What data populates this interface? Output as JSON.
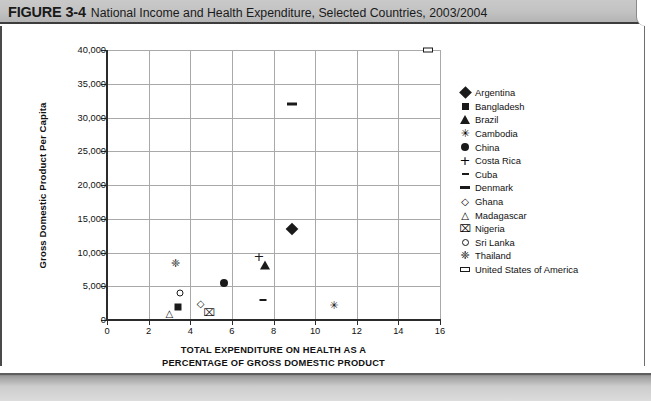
{
  "header": {
    "figure_label": "FIGURE 3-4",
    "figure_title": "National Income and Health Expenditure, Selected Countries, 2003/2004"
  },
  "chart_data": {
    "type": "scatter",
    "title": "National Income and Health Expenditure, Selected Countries, 2003/2004",
    "xlabel_line1": "TOTAL EXPENDITURE ON HEALTH AS A",
    "xlabel_line2": "PERCENTAGE OF GROSS DOMESTIC PRODUCT",
    "ylabel": "Gross Domestic Product Per Capita",
    "xlim": [
      0,
      16
    ],
    "ylim": [
      0,
      40000
    ],
    "xticks": [
      "0",
      "2",
      "4",
      "6",
      "8",
      "10",
      "12",
      "14",
      "16"
    ],
    "xtick_values": [
      0,
      2,
      4,
      6,
      8,
      10,
      12,
      14,
      16
    ],
    "yticks": [
      "0",
      "5,000",
      "10,000",
      "15,000",
      "20,000",
      "25,000",
      "30,000",
      "35,000",
      "40,000"
    ],
    "ytick_values": [
      0,
      5000,
      10000,
      15000,
      20000,
      25000,
      30000,
      35000,
      40000
    ],
    "grid": true,
    "legend_position": "right",
    "points": [
      {
        "name": "Argentina",
        "marker": "diamond-filled",
        "x": 8.9,
        "y": 13500
      },
      {
        "name": "Bangladesh",
        "marker": "square-filled",
        "x": 3.4,
        "y": 2000
      },
      {
        "name": "Brazil",
        "marker": "triangle-filled",
        "x": 7.6,
        "y": 8200
      },
      {
        "name": "Cambodia",
        "marker": "asterisk",
        "x": 10.9,
        "y": 2200
      },
      {
        "name": "China",
        "marker": "circle-filled",
        "x": 5.6,
        "y": 5500
      },
      {
        "name": "Costa Rica",
        "marker": "plus",
        "x": 7.3,
        "y": 9500
      },
      {
        "name": "Cuba",
        "marker": "dash-small",
        "x": 7.5,
        "y": 3000
      },
      {
        "name": "Denmark",
        "marker": "dash-large",
        "x": 8.9,
        "y": 32000
      },
      {
        "name": "Ghana",
        "marker": "diamond-open",
        "x": 4.5,
        "y": 2300
      },
      {
        "name": "Madagascar",
        "marker": "triangle-open",
        "x": 3.0,
        "y": 900
      },
      {
        "name": "Nigeria",
        "marker": "boxed-x",
        "x": 4.9,
        "y": 1100
      },
      {
        "name": "Sri Lanka",
        "marker": "circle-open",
        "x": 3.5,
        "y": 4000
      },
      {
        "name": "Thailand",
        "marker": "diamond-cross",
        "x": 3.3,
        "y": 8500
      },
      {
        "name": "United States of America",
        "marker": "rect-open",
        "x": 15.4,
        "y": 40000
      }
    ]
  },
  "legend": {
    "entries": [
      {
        "label": "Argentina",
        "marker": "diamond-filled"
      },
      {
        "label": "Bangladesh",
        "marker": "square-filled"
      },
      {
        "label": "Brazil",
        "marker": "triangle-filled"
      },
      {
        "label": "Cambodia",
        "marker": "asterisk"
      },
      {
        "label": "China",
        "marker": "circle-filled"
      },
      {
        "label": "Costa Rica",
        "marker": "plus"
      },
      {
        "label": "Cuba",
        "marker": "dash-small"
      },
      {
        "label": "Denmark",
        "marker": "dash-large"
      },
      {
        "label": "Ghana",
        "marker": "diamond-open"
      },
      {
        "label": "Madagascar",
        "marker": "triangle-open"
      },
      {
        "label": "Nigeria",
        "marker": "boxed-x"
      },
      {
        "label": "Sri Lanka",
        "marker": "circle-open"
      },
      {
        "label": "Thailand",
        "marker": "diamond-cross"
      },
      {
        "label": "United States of America",
        "marker": "rect-open"
      }
    ]
  },
  "colors": {
    "ink": "#1a1a1a",
    "grid": "#a9a9a9",
    "band": "#c2c2c2",
    "paper": "#ffffff"
  }
}
